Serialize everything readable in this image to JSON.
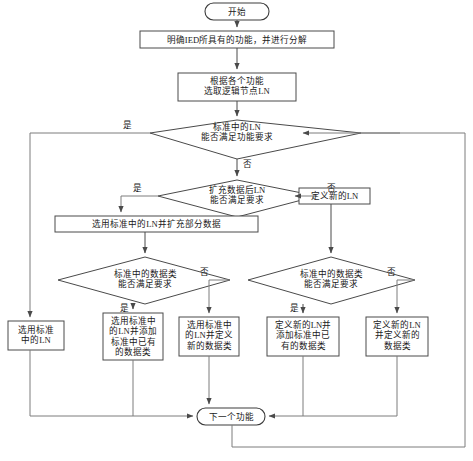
{
  "diagram": {
    "colors": {
      "background": "#ffffff",
      "node_stroke": "#4a4a4a",
      "edge_stroke": "#7d7d7d",
      "text": "#1a1a1a"
    },
    "nodes": [
      {
        "id": "start",
        "type": "terminal",
        "label": "开始"
      },
      {
        "id": "clarify",
        "type": "process",
        "label": "明确IED所具有的功能，并进行分解"
      },
      {
        "id": "selectln",
        "type": "process",
        "label": "根据各个功能\n选取逻辑节点LN"
      },
      {
        "id": "dec_ln",
        "type": "decision",
        "label": "标准中的LN\n能否满足功能要求"
      },
      {
        "id": "dec_ext",
        "type": "decision",
        "label": "扩充数据后LN\n能否满足要求"
      },
      {
        "id": "newln",
        "type": "process",
        "label": "定义新的LN"
      },
      {
        "id": "use_ext",
        "type": "process",
        "label": "选用标准中的LN并扩充部分数据"
      },
      {
        "id": "dec_dt_l",
        "type": "decision",
        "label": "标准中的数据类\n能否满足要求"
      },
      {
        "id": "dec_dt_r",
        "type": "decision",
        "label": "标准中的数据类\n能否满足要求"
      },
      {
        "id": "r1",
        "type": "process",
        "label": "选用标准\n中的LN"
      },
      {
        "id": "r2",
        "type": "process",
        "label": "选用标准中\n的LN并添加\n标准中已有\n的数据类"
      },
      {
        "id": "r3",
        "type": "process",
        "label": "选用标准中\n的LN并定义\n新的数据类"
      },
      {
        "id": "r4",
        "type": "process",
        "label": "定义新的LN并\n添加标准中已\n有的数据类"
      },
      {
        "id": "r5",
        "type": "process",
        "label": "定义新的LN\n并定义新的\n数据类"
      },
      {
        "id": "next",
        "type": "terminal",
        "label": "下一个功能"
      }
    ],
    "edge_labels": {
      "dec_ln_yes": "是",
      "dec_ln_no": "否",
      "dec_ext_yes": "是",
      "dec_ext_no": "否",
      "dec_dt_l_yes": "是",
      "dec_dt_l_no": "否",
      "dec_dt_r_yes": "是",
      "dec_dt_r_no": "否"
    }
  }
}
